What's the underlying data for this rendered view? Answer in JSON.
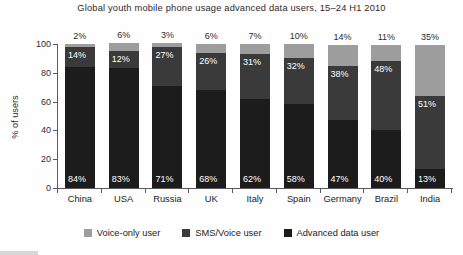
{
  "chart_data": {
    "type": "bar",
    "subtype": "stacked-column-100pct",
    "title": "Global youth mobile phone usage advanced data users, 15–24 H1 2010",
    "xlabel": "",
    "ylabel": "% of users",
    "ylim": [
      0,
      100
    ],
    "yticks": [
      0,
      20,
      40,
      60,
      80,
      100
    ],
    "ytick_labels": [
      "0",
      "20",
      "40",
      "60",
      "80",
      "100"
    ],
    "grid": false,
    "legend_position": "bottom-center",
    "categories": [
      "China",
      "USA",
      "Russia",
      "UK",
      "Italy",
      "Spain",
      "Germany",
      "Brazil",
      "India"
    ],
    "series": [
      {
        "name": "Voice-only user",
        "color": "#9d9d9d",
        "values": [
          2,
          6,
          3,
          6,
          7,
          10,
          14,
          11,
          35
        ],
        "labels": [
          "2%",
          "6%",
          "3%",
          "6%",
          "7%",
          "10%",
          "14%",
          "11%",
          "35%"
        ],
        "label_placement": "above-bar"
      },
      {
        "name": "SMS/Voice user",
        "color": "#3a3a3a",
        "values": [
          14,
          12,
          27,
          26,
          31,
          32,
          38,
          48,
          51
        ],
        "labels": [
          "14%",
          "12%",
          "27%",
          "26%",
          "31%",
          "32%",
          "38%",
          "48%",
          "51%"
        ],
        "label_placement": "inside-top"
      },
      {
        "name": "Advanced data user",
        "color": "#1c1c1c",
        "values": [
          84,
          83,
          71,
          68,
          62,
          58,
          47,
          40,
          13
        ],
        "labels": [
          "84%",
          "83%",
          "71%",
          "68%",
          "62%",
          "58%",
          "47%",
          "40%",
          "13%"
        ],
        "label_placement": "inside-bottom"
      }
    ],
    "annotations": []
  },
  "legend": {
    "items": [
      {
        "label": "Voice-only user",
        "color": "#9d9d9d"
      },
      {
        "label": "SMS/Voice user",
        "color": "#3a3a3a"
      },
      {
        "label": "Advanced data user",
        "color": "#1c1c1c"
      }
    ]
  }
}
